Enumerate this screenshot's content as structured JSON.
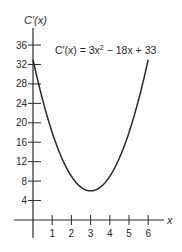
{
  "chart_data": {
    "type": "line",
    "title": "",
    "xlabel": "x",
    "ylabel": "C′(x)",
    "annotation": "C′(x) = 3x² − 18x + 33",
    "function": "3x^2 - 18x + 33",
    "xlim": [
      0,
      6.5
    ],
    "ylim": [
      0,
      38
    ],
    "x_ticks": [
      1,
      2,
      3,
      4,
      5,
      6
    ],
    "y_ticks": [
      4,
      8,
      12,
      16,
      20,
      24,
      28,
      32,
      36
    ],
    "grid": false,
    "legend": "none",
    "series": [
      {
        "name": "C′(x)",
        "x": [
          0,
          0.5,
          1,
          1.5,
          2,
          2.5,
          3,
          3.5,
          4,
          4.5,
          5,
          5.5,
          6
        ],
        "values": [
          33,
          24.75,
          18,
          12.75,
          9,
          6.75,
          6,
          6.75,
          9,
          12.75,
          18,
          24.75,
          33
        ]
      }
    ],
    "minimum": {
      "x": 3,
      "y": 6
    }
  },
  "labels": {
    "y_axis": "C′(x)",
    "x_axis": "x",
    "formula_prefix": "C′(x) = 3x",
    "formula_exp": "2",
    "formula_suffix": " − 18x + 33",
    "x_ticks": [
      "1",
      "2",
      "3",
      "4",
      "5",
      "6"
    ],
    "y_ticks": [
      "4",
      "8",
      "12",
      "16",
      "20",
      "24",
      "28",
      "32",
      "36"
    ]
  },
  "colors": {
    "ink": "#2a2a2a",
    "background": "#ffffff"
  }
}
